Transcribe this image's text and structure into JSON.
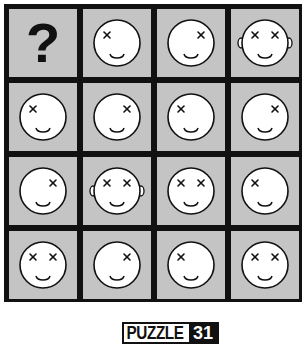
{
  "puzzle": {
    "title_word": "PUZZLE",
    "number": "31",
    "unknown_symbol": "?",
    "colors": {
      "cell_bg": "#c4c4c4",
      "grid_line": "#111111",
      "face": "#ffffff"
    },
    "grid": [
      [
        {
          "type": "question"
        },
        {
          "type": "face",
          "left_eye": true,
          "right_eye": false,
          "ears": false
        },
        {
          "type": "face",
          "left_eye": false,
          "right_eye": true,
          "ears": false
        },
        {
          "type": "face",
          "left_eye": true,
          "right_eye": true,
          "ears": true
        }
      ],
      [
        {
          "type": "face",
          "left_eye": true,
          "right_eye": false,
          "ears": false
        },
        {
          "type": "face",
          "left_eye": false,
          "right_eye": true,
          "ears": false
        },
        {
          "type": "face",
          "left_eye": true,
          "right_eye": false,
          "ears": false
        },
        {
          "type": "face",
          "left_eye": false,
          "right_eye": true,
          "ears": false
        }
      ],
      [
        {
          "type": "face",
          "left_eye": false,
          "right_eye": true,
          "ears": false
        },
        {
          "type": "face",
          "left_eye": true,
          "right_eye": true,
          "ears": true
        },
        {
          "type": "face",
          "left_eye": true,
          "right_eye": true,
          "ears": false
        },
        {
          "type": "face",
          "left_eye": true,
          "right_eye": false,
          "ears": false
        }
      ],
      [
        {
          "type": "face",
          "left_eye": true,
          "right_eye": true,
          "ears": false
        },
        {
          "type": "face",
          "left_eye": false,
          "right_eye": true,
          "ears": false
        },
        {
          "type": "face",
          "left_eye": true,
          "right_eye": false,
          "ears": false
        },
        {
          "type": "face",
          "left_eye": true,
          "right_eye": true,
          "ears": false
        }
      ]
    ]
  }
}
